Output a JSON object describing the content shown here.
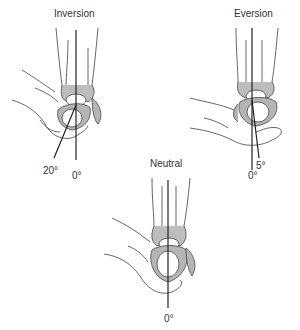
{
  "figures": [
    {
      "id": "inversion",
      "title": "Inversion",
      "angles": [
        "20°",
        "0°"
      ]
    },
    {
      "id": "eversion",
      "title": "Eversion",
      "angles": [
        "5°",
        "0°"
      ]
    },
    {
      "id": "neutral",
      "title": "Neutral",
      "angles": [
        "0°"
      ]
    }
  ],
  "colors": {
    "bone_fill": "#b5b5b5",
    "outline": "#555555",
    "line": "#222222"
  }
}
